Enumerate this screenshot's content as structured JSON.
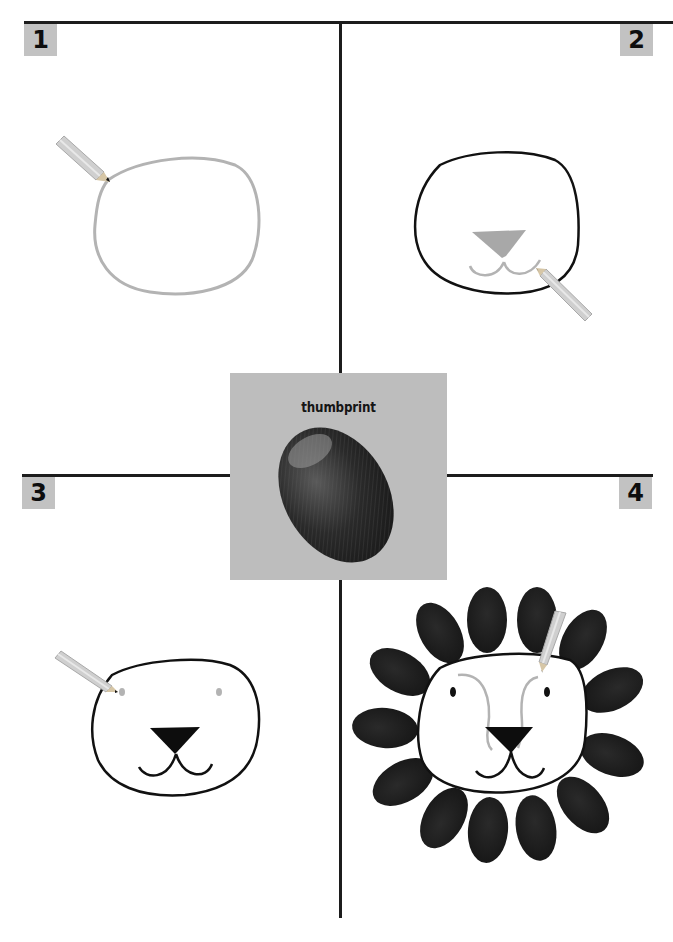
{
  "steps": [
    {
      "number": "1",
      "description": "Draw a head outline"
    },
    {
      "number": "2",
      "description": "Draw the nose and mouth"
    },
    {
      "number": "3",
      "description": "Add eyes"
    },
    {
      "number": "4",
      "description": "Add thumbprint mane and ear markings"
    }
  ],
  "center_panel": {
    "label": "thumbprint"
  },
  "colors": {
    "badge_bg": "#c2c2c2",
    "panel_bg": "#bdbdbd",
    "guide_line": "#b3b3b3",
    "ink": "#111111"
  }
}
